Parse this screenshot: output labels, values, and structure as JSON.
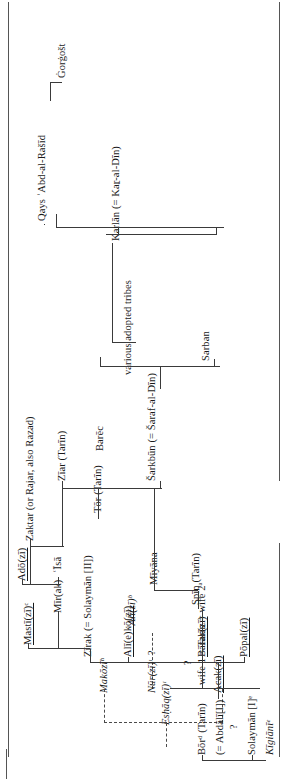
{
  "figure": {
    "type": "genealogical-tree",
    "orientation": "rotated-90-counterclockwise",
    "root": "Qays ʿAbd-al-Rašīd"
  },
  "nodes": {
    "qays": "Qays  ʿAbd-al-Rašīd",
    "gorgost": "Ġorġošt",
    "karlan": "Karlān (= Kaṟ-al-Dīn)",
    "sarban": "Sarban",
    "various": "various adopted tribes",
    "sarkbun": "Šarkbūn (= Šaraf-al-Dīn)",
    "barec": "Barēc",
    "ziar": "Zīar (Tarīn)",
    "miyana": "Mīyāna",
    "tor": "Tōr (Tarīn)",
    "zaktar": "Zaktar (or Rajar, also Razad)",
    "spin": "Spīn (Tarīn)",
    "isa": "ʿĪsā",
    "ado": "Adō(zī)",
    "wives": "wife 1 = Tarīn = wife 2ᵃ",
    "alizi": "ʿAlī(zī)ᵇ",
    "mirak": "Mīr(ak)",
    "mastizi": "Mastī(zī)ᶜ",
    "zirak": "Zīrak (= Solaymān [II])",
    "alikozi": "Alī(e)kō(zī)",
    "barakzi": "Bārak(zī)",
    "popalzi": "Pōpal(zī)",
    "acakzi": "Acak(zī)",
    "bor": "Bōrᵈ (Tarīn)",
    "abdali": "(= Abdālī[I])",
    "solayman1": "Solaymān [I]ᵉ",
    "kigiani": "Kīgiānīᵉ",
    "makozi": "Makōzīʰ",
    "nurzi": "Nūr(zī)ᶦ",
    "eshaqzi": "Esḥāq(zī)ᶦ",
    "q1": "?",
    "q2": "?",
    "q3": "?"
  },
  "colors": {
    "text": "#1a1a1a",
    "line": "#3a3a3a",
    "rule": "#555555",
    "background": "#ffffff"
  }
}
